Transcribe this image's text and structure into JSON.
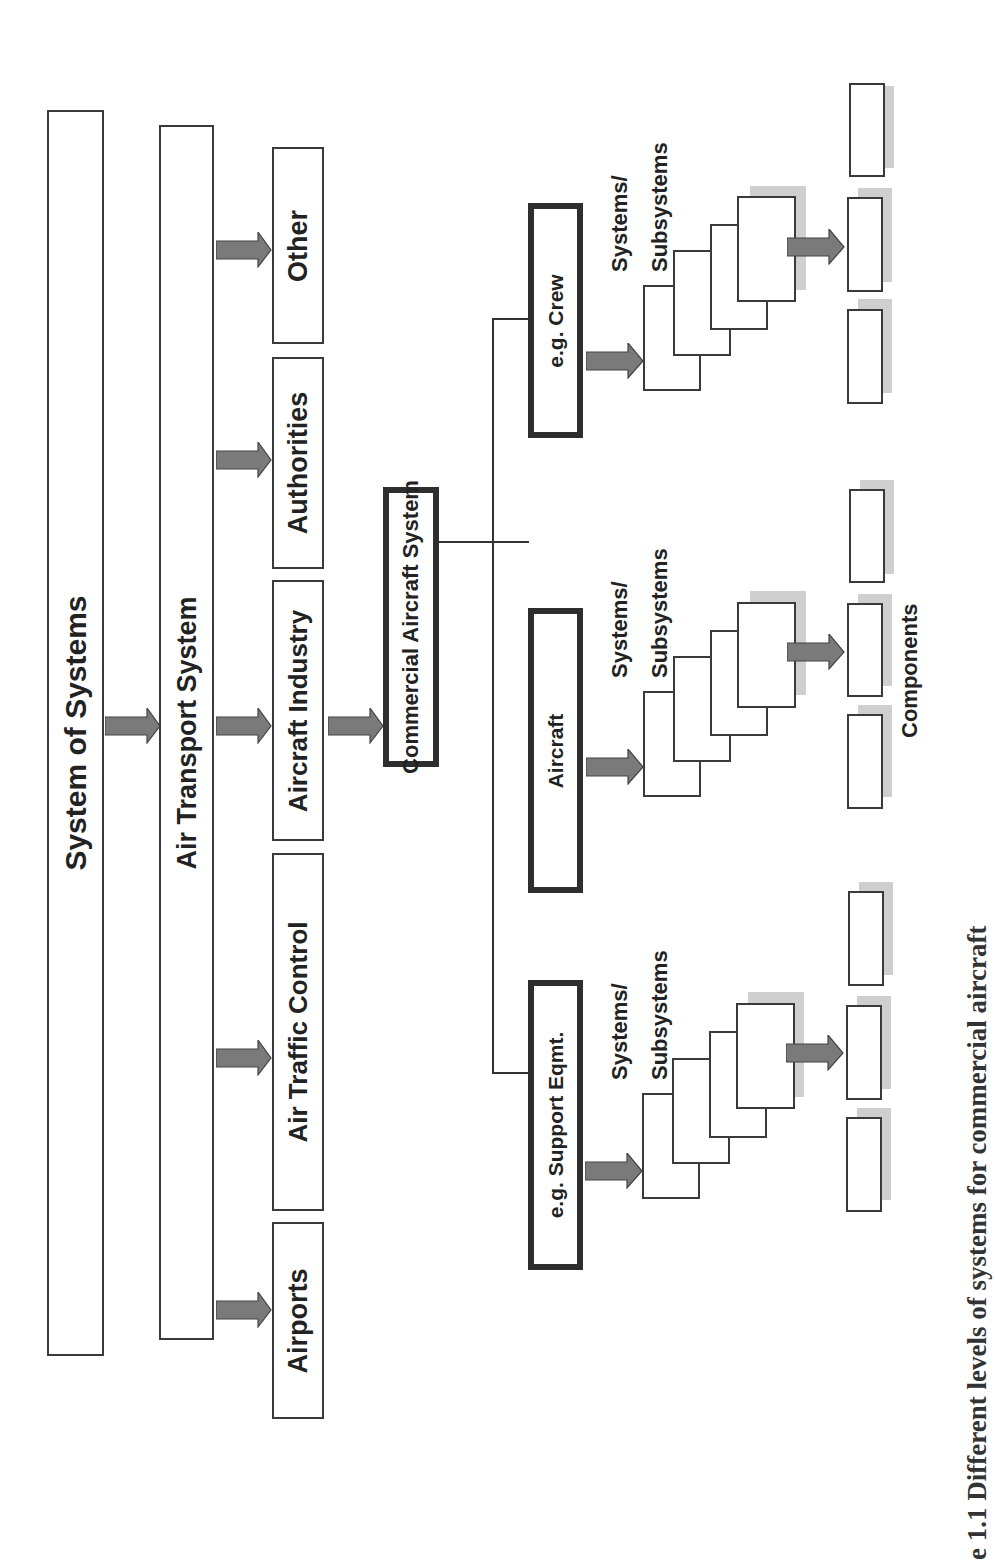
{
  "diagram": {
    "level1": {
      "label": "System of Systems"
    },
    "level2": {
      "label": "Air Transport System"
    },
    "level3": [
      {
        "label": "Other"
      },
      {
        "label": "Authorities"
      },
      {
        "label": "Aircraft Industry"
      },
      {
        "label": "Air Traffic Control"
      },
      {
        "label": "Airports"
      }
    ],
    "level4": {
      "label": "Commercial Aircraft System"
    },
    "level5": [
      {
        "label": "e.g. Crew",
        "sublabel_line1": "Systems/",
        "sublabel_line2": "Subsystems"
      },
      {
        "label": "Aircraft",
        "sublabel_line1": "Systems/",
        "sublabel_line2": "Subsystems"
      },
      {
        "label": "e.g. Support Eqmt.",
        "sublabel_line1": "Systems/",
        "sublabel_line2": "Subsystems"
      }
    ],
    "components_label": "Components",
    "colors": {
      "arrow_fill": "#7a7a7a",
      "border": "#333333",
      "shadow": "#cfcfcf"
    }
  },
  "caption": "e 1.1    Different levels of systems for commercial aircraft",
  "orientation": "rotated -90deg"
}
